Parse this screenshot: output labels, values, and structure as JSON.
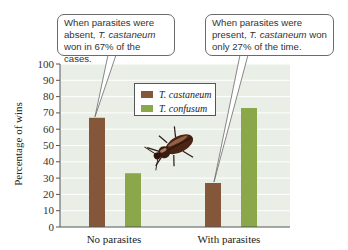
{
  "chart_data": {
    "type": "bar",
    "title": "",
    "xlabel": "",
    "ylabel": "Percentage of wins",
    "ylim": [
      0,
      100
    ],
    "yticks": [
      0,
      10,
      20,
      30,
      40,
      50,
      60,
      70,
      80,
      90,
      100
    ],
    "grid": true,
    "categories": [
      "No parasites",
      "With parasites"
    ],
    "series": [
      {
        "name": "T. castaneum",
        "color": "#85573a",
        "values": [
          67,
          27
        ]
      },
      {
        "name": "T. confusum",
        "color": "#8aa84a",
        "values": [
          33,
          73
        ]
      }
    ],
    "legend_position": "top-center",
    "annotations": [
      {
        "target": "No parasites / T. castaneum",
        "text_parts": [
          "When parasites were absent, ",
          "T. castaneum",
          " won in 67% of the cases."
        ]
      },
      {
        "target": "With parasites / T. castaneum",
        "text_parts": [
          "When parasites were present, ",
          "T. castaneum",
          " won only 27% of the time."
        ]
      }
    ],
    "decoration": "beetle-illustration"
  },
  "colors": {
    "plot_background": "#e9efe6",
    "gridline": "#ffffff",
    "axis": "#555555"
  }
}
